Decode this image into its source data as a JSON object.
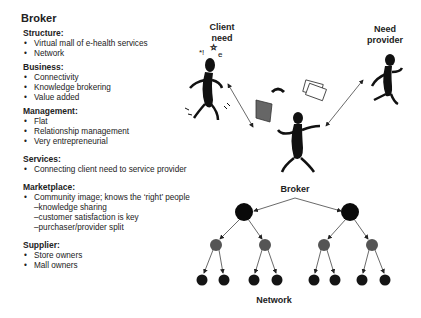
{
  "left_panel": {
    "title": "Broker",
    "sections": [
      {
        "heading": "Structure:",
        "items": [
          "Virtual mall of e-health services",
          "Network"
        ]
      },
      {
        "heading": "Business:",
        "items": [
          "Connectivity",
          "Knowledge brokering",
          "Value added"
        ]
      },
      {
        "heading": "Management:",
        "items": [
          "Flat",
          "Relationship management",
          "Very entrepreneurial"
        ]
      },
      {
        "heading": "Services:",
        "items": [
          "Connecting client need to service provider"
        ]
      },
      {
        "heading": "Marketplace:",
        "items": [
          "Community image; knows the ‘right’ people"
        ],
        "subitems": [
          "–knowledge sharing",
          "–customer satisfaction is key",
          "–purchaser/provider split"
        ]
      },
      {
        "heading": "Supplier:",
        "items": [
          "Store owners",
          "Mall owners"
        ]
      }
    ]
  },
  "diagram": {
    "client_label_1": "Client",
    "client_label_2": "need",
    "provider_label_1": "Need",
    "provider_label_2": "provider",
    "broker_label": "Broker",
    "network_label": "Network"
  }
}
